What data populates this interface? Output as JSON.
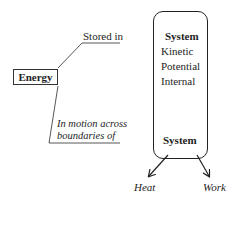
{
  "diagram": {
    "energy_label": "Energy",
    "stored_label": "Stored in",
    "motion_label_line1": "In motion across",
    "motion_label_line2": "boundaries of",
    "system_box": {
      "title": "System",
      "items": [
        "Kinetic",
        "Potential",
        "Internal"
      ],
      "bottom_label": "System"
    },
    "outputs": [
      "Heat",
      "Work"
    ]
  }
}
